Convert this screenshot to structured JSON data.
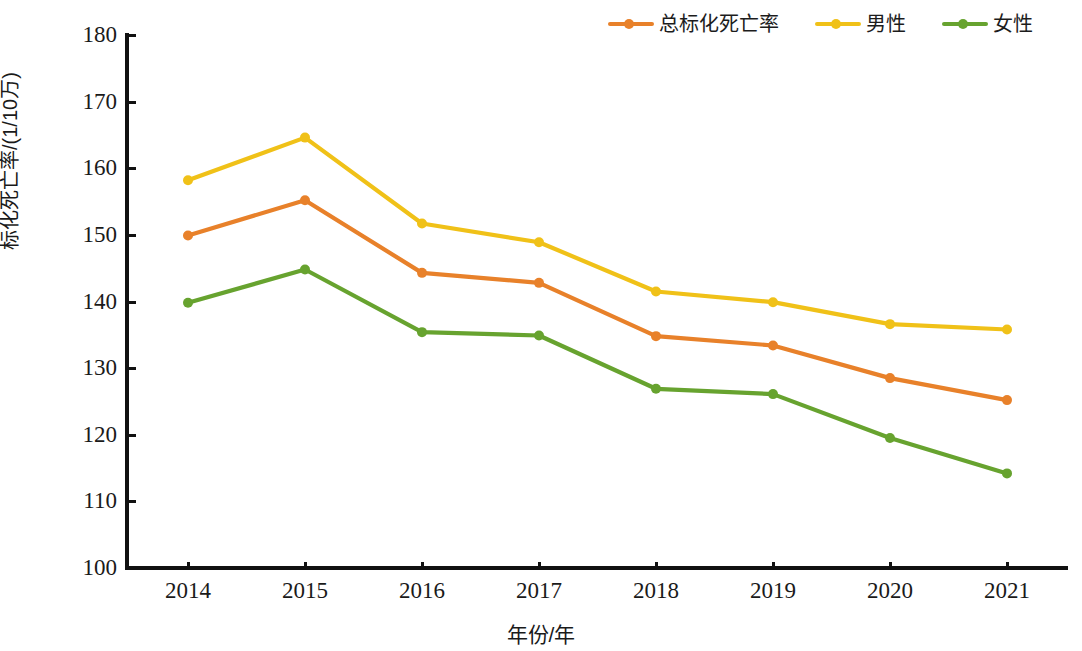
{
  "chart_data": {
    "type": "line",
    "title": "",
    "xlabel": "年份/年",
    "ylabel": "标化死亡率/(1/10万)",
    "categories": [
      "2014",
      "2015",
      "2016",
      "2017",
      "2018",
      "2019",
      "2020",
      "2021"
    ],
    "x": [
      2014,
      2015,
      2016,
      2017,
      2018,
      2019,
      2020,
      2021
    ],
    "ylim": [
      100,
      180
    ],
    "yticks": [
      100,
      110,
      120,
      130,
      140,
      150,
      160,
      170,
      180
    ],
    "ytick_labels": [
      "100",
      "110",
      "120",
      "130",
      "140",
      "150",
      "160",
      "170",
      "180"
    ],
    "grid": false,
    "legend_position": "top-right",
    "markers": "circle",
    "series": [
      {
        "name": "总标化死亡率",
        "color": "#E8812A",
        "values": [
          149.9,
          155.2,
          144.3,
          142.8,
          134.8,
          133.4,
          128.5,
          125.2
        ]
      },
      {
        "name": "男性",
        "color": "#F0C118",
        "values": [
          158.2,
          164.6,
          151.7,
          148.9,
          141.5,
          139.9,
          136.6,
          135.8
        ]
      },
      {
        "name": "女性",
        "color": "#67A32F",
        "values": [
          139.8,
          144.8,
          135.4,
          134.9,
          126.9,
          126.1,
          119.5,
          114.2
        ]
      }
    ]
  },
  "legend": {
    "items": [
      {
        "label": "总标化死亡率",
        "color": "#E8812A"
      },
      {
        "label": "男性",
        "color": "#F0C118"
      },
      {
        "label": "女性",
        "color": "#67A32F"
      }
    ]
  },
  "axes": {
    "x_title": "年份/年",
    "y_title": "标化死亡率/(1/10万)"
  }
}
